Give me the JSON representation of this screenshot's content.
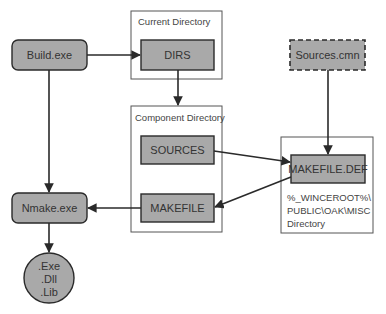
{
  "colors": {
    "node_fill": "#a9a9a9",
    "stroke": "#2a2a2a",
    "container_stroke": "#555555",
    "background": "#ffffff"
  },
  "containers": {
    "current_directory": {
      "label": "Current Directory"
    },
    "component_directory": {
      "label": "Component Directory"
    },
    "misc_directory": {
      "lines": [
        "%_WINCEROOT%\\",
        "PUBLIC\\OAK\\MISC",
        "Directory"
      ]
    }
  },
  "nodes": {
    "build_exe": {
      "label": "Build.exe",
      "shape": "rounded-rect"
    },
    "dirs": {
      "label": "DIRS",
      "shape": "rect"
    },
    "sources_cmn": {
      "label": "Sources.cmn",
      "shape": "dashed-rect"
    },
    "sources": {
      "label": "SOURCES",
      "shape": "rect"
    },
    "makefile_def": {
      "label": "MAKEFILE.DEF",
      "shape": "rect"
    },
    "makefile": {
      "label": "MAKEFILE",
      "shape": "rect"
    },
    "nmake_exe": {
      "label": "Nmake.exe",
      "shape": "rounded-rect"
    },
    "outputs": {
      "lines": [
        ".Exe",
        ".Dll",
        ".Lib"
      ],
      "shape": "circle"
    }
  },
  "edges": [
    {
      "from": "Build.exe",
      "to": "DIRS"
    },
    {
      "from": "Build.exe",
      "to": "Nmake.exe"
    },
    {
      "from": "DIRS",
      "to": "Component Directory"
    },
    {
      "from": "Sources.cmn",
      "to": "MAKEFILE.DEF"
    },
    {
      "from": "SOURCES",
      "to": "MAKEFILE.DEF"
    },
    {
      "from": "MAKEFILE.DEF",
      "to": "MAKEFILE"
    },
    {
      "from": "MAKEFILE",
      "to": "Nmake.exe"
    },
    {
      "from": "Nmake.exe",
      "to": ".Exe/.Dll/.Lib"
    }
  ]
}
